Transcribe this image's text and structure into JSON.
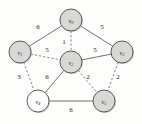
{
  "figure": {
    "type": "graph-diagram",
    "background_color": "#fdfdfc"
  },
  "graph": {
    "nodes": [
      {
        "id": "v0",
        "label": "v",
        "subscript": "0",
        "x": 71,
        "y": 20,
        "r": 11,
        "shaded": true
      },
      {
        "id": "v1",
        "label": "v",
        "subscript": "1",
        "x": 20,
        "y": 52,
        "r": 11,
        "shaded": true
      },
      {
        "id": "v2",
        "label": "v",
        "subscript": "2",
        "x": 71,
        "y": 62,
        "r": 11,
        "shaded": true
      },
      {
        "id": "v3",
        "label": "v",
        "subscript": "3",
        "x": 122,
        "y": 52,
        "r": 11,
        "shaded": true
      },
      {
        "id": "v4",
        "label": "v",
        "subscript": "4",
        "x": 38,
        "y": 101,
        "r": 11,
        "shaded": false
      },
      {
        "id": "v5",
        "label": "v",
        "subscript": "5",
        "x": 104,
        "y": 101,
        "r": 11,
        "shaded": true
      }
    ],
    "edges": [
      {
        "from": "v0",
        "to": "v1",
        "weight": "6",
        "style": "solid",
        "label_x": 38,
        "label_y": 27
      },
      {
        "from": "v0",
        "to": "v3",
        "weight": "5",
        "style": "solid",
        "label_x": 102,
        "label_y": 27
      },
      {
        "from": "v0",
        "to": "v2",
        "weight": "1",
        "style": "dashed",
        "label_x": 64,
        "label_y": 42
      },
      {
        "from": "v1",
        "to": "v2",
        "weight": "5",
        "style": "dashed",
        "label_x": 47,
        "label_y": 50
      },
      {
        "from": "v2",
        "to": "v3",
        "weight": "5",
        "style": "solid",
        "label_x": 95,
        "label_y": 50
      },
      {
        "from": "v1",
        "to": "v4",
        "weight": "3",
        "style": "dashed",
        "label_x": 19,
        "label_y": 77
      },
      {
        "from": "v2",
        "to": "v4",
        "weight": "6",
        "style": "solid",
        "label_x": 47,
        "label_y": 77
      },
      {
        "from": "v2",
        "to": "v5",
        "weight": "2",
        "style": "dashed",
        "label_x": 88,
        "label_y": 77
      },
      {
        "from": "v3",
        "to": "v5",
        "weight": "2",
        "style": "dashed",
        "label_x": 118,
        "label_y": 77
      },
      {
        "from": "v4",
        "to": "v5",
        "weight": "6",
        "style": "solid",
        "label_x": 71,
        "label_y": 110
      }
    ]
  },
  "colors": {
    "node_fill_shaded": "#d8d8d6",
    "node_fill_plain": "#ffffff",
    "node_stroke": "#4a4a4a",
    "edge_stroke": "#5a5a5a",
    "text": "#1c1c1c"
  }
}
